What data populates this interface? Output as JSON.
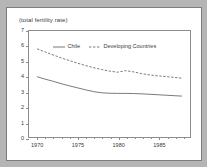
{
  "figure": {
    "title": "(total fertility rate)",
    "background_color": "#b5b5b5",
    "paper_color": "#ffffff",
    "axis_color": "#8c8c8c",
    "text_color": "#3a3a3a"
  },
  "legend": {
    "position": "top-center",
    "entries": [
      {
        "label": "Chile",
        "style": "solid",
        "icon": "solid-line-icon"
      },
      {
        "label": "Developing Countries",
        "style": "dashed",
        "icon": "dashed-line-icon"
      }
    ]
  },
  "chart_data": {
    "type": "line",
    "title": "(total fertility rate)",
    "xlabel": "",
    "ylabel": "",
    "xlim": [
      1969,
      1989
    ],
    "ylim": [
      0,
      7
    ],
    "grid": false,
    "legend_position": "top-center",
    "y_ticks": [
      0,
      1,
      2,
      3,
      4,
      5,
      6,
      7
    ],
    "y_tick_labels": [
      "0",
      "1",
      "2",
      "3",
      "4",
      "5",
      "6",
      "7"
    ],
    "x_ticks": [
      1970,
      1971,
      1972,
      1973,
      1974,
      1975,
      1976,
      1977,
      1978,
      1979,
      1980,
      1981,
      1982,
      1983,
      1984,
      1985,
      1986,
      1987,
      1988
    ],
    "x_labeled_ticks": [
      1970,
      1975,
      1980,
      1985
    ],
    "x_tick_labels": [
      "1970",
      "1975",
      "1980",
      "1985"
    ],
    "x": [
      1970,
      1971,
      1972,
      1973,
      1974,
      1975,
      1976,
      1977,
      1978,
      1979,
      1980,
      1981,
      1982,
      1983,
      1984,
      1985,
      1986,
      1987,
      1988
    ],
    "series": [
      {
        "name": "Chile",
        "style": "solid",
        "color": "#555555",
        "values": [
          3.98,
          3.82,
          3.68,
          3.52,
          3.38,
          3.25,
          3.12,
          3.0,
          2.92,
          2.89,
          2.88,
          2.88,
          2.87,
          2.85,
          2.82,
          2.79,
          2.76,
          2.73,
          2.7
        ]
      },
      {
        "name": "Developing Countries",
        "style": "dashed",
        "color": "#555555",
        "values": [
          5.82,
          5.62,
          5.42,
          5.22,
          5.05,
          4.88,
          4.72,
          4.58,
          4.46,
          4.35,
          4.28,
          4.38,
          4.3,
          4.18,
          4.1,
          4.04,
          3.99,
          3.94,
          3.88
        ]
      }
    ]
  }
}
